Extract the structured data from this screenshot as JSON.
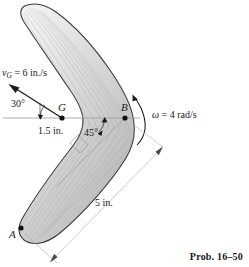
{
  "figure": {
    "caption": "Prob. 16–50",
    "points": [
      {
        "id": "A",
        "label": "A",
        "x": 20,
        "y": 228
      },
      {
        "id": "G",
        "label": "G",
        "x": 62,
        "y": 118
      },
      {
        "id": "B",
        "label": "B",
        "x": 125,
        "y": 118
      }
    ],
    "velocity": {
      "symbol": "v",
      "subscript": "G",
      "equals": "=",
      "value": "6",
      "units": "in./s",
      "full_label": "v_G = 6 in./s",
      "angle_label": "30°",
      "arrow_from": {
        "x": 62,
        "y": 118
      },
      "arrow_to": {
        "x": 11,
        "y": 85
      }
    },
    "angular_velocity": {
      "symbol": "ω",
      "equals": "=",
      "value": "4",
      "units": "rad/s",
      "full_label": "ω = 4 rad/s",
      "direction": "counterclockwise"
    },
    "dimensions": [
      {
        "id": "GB",
        "label": "1.5 in.",
        "value": 1.5,
        "units": "in."
      },
      {
        "id": "AB",
        "label": "5 in.",
        "value": 5,
        "units": "in."
      }
    ],
    "angles": [
      {
        "id": "v-axis",
        "label": "30°",
        "value": 30
      },
      {
        "id": "arm-arm",
        "label": "45°",
        "value": 45
      }
    ],
    "colors": {
      "body_light": "#e8e8e8",
      "body_mid": "#c9c9c9",
      "body_dark": "#a8a8a8",
      "outline": "#3a3a3a",
      "dim_line": "#b9b9b9",
      "axis_line": "#9a9a9a",
      "text": "#1a1a1a"
    }
  }
}
